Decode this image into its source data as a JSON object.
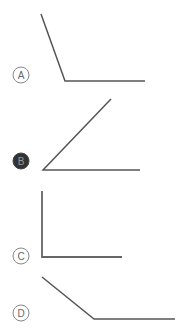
{
  "options": [
    {
      "label": "A",
      "selected": false,
      "circle": {
        "cx": 21,
        "cy": 75,
        "r": 8
      },
      "path": [
        [
          41,
          14
        ],
        [
          65,
          81
        ],
        [
          145,
          81
        ]
      ]
    },
    {
      "label": "B",
      "selected": true,
      "circle": {
        "cx": 21,
        "cy": 161,
        "r": 8
      },
      "path": [
        [
          111,
          99
        ],
        [
          43,
          170
        ],
        [
          140,
          170
        ]
      ]
    },
    {
      "label": "C",
      "selected": false,
      "circle": {
        "cx": 21,
        "cy": 256,
        "r": 8
      },
      "path": [
        [
          42,
          191
        ],
        [
          42,
          257
        ],
        [
          122,
          257
        ]
      ]
    },
    {
      "label": "D",
      "selected": false,
      "circle": {
        "cx": 21,
        "cy": 313,
        "r": 8
      },
      "path": [
        [
          42,
          277
        ],
        [
          94,
          319
        ],
        [
          175,
          319
        ]
      ]
    }
  ],
  "colors": {
    "line": "#555555",
    "circle_stroke": "#888888",
    "label_text": "#666666",
    "selected_fill": "#333333",
    "selected_text": "#999999"
  }
}
